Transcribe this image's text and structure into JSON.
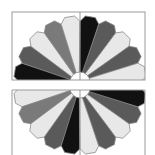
{
  "figure": {
    "colors": {
      "black": "#111111",
      "dark_gray": "#5a5a5a",
      "mid_gray": "#7a7a7a",
      "light": "#e8e8e8",
      "outline": "#8a8a8a",
      "frame": "#9a9a9a",
      "hub": "#ffffff"
    },
    "upper_fan": {
      "blades_left_to_right": [
        "black",
        "dark_gray",
        "light",
        "mid_gray",
        "light",
        "black",
        "dark_gray",
        "light",
        "dark_gray",
        "light"
      ]
    },
    "lower_fan": {
      "blades_left_to_right": [
        "light",
        "mid_gray",
        "light",
        "dark_gray",
        "black",
        "light",
        "dark_gray",
        "light",
        "dark_gray",
        "black"
      ]
    }
  }
}
